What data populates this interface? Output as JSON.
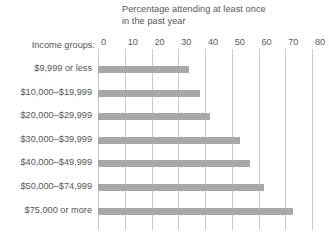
{
  "chart_data": {
    "type": "bar",
    "orientation": "horizontal",
    "title": "Percentage attending at least once\nin the past year",
    "xlabel": "",
    "ylabel": "Income groups:",
    "categories": [
      "$9,999 or less",
      "$10,000–$19,999",
      "$20,000–$29,999",
      "$30,000–$39,999",
      "$40,000–$49,999",
      "$50,000–$74,999",
      "$75,000 or more"
    ],
    "values": [
      34,
      38,
      42,
      53,
      57,
      62,
      73
    ],
    "xlim": [
      0,
      80
    ],
    "xticks": [
      0,
      10,
      20,
      30,
      40,
      50,
      60,
      70,
      80
    ],
    "xtick_labels": [
      "0",
      "10",
      "20",
      "30",
      "40",
      "50",
      "60",
      "70",
      "80"
    ],
    "grid": true,
    "legend": false,
    "bar_color": "#a8a8a8",
    "gridline_color": "#c9c9c9",
    "text_color": "#555555",
    "background": "#ffffff"
  }
}
